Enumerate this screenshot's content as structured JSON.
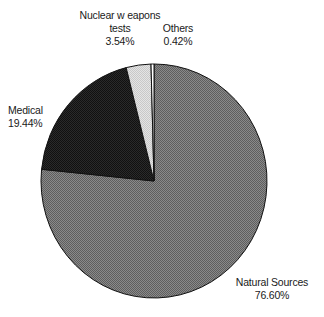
{
  "chart_data": {
    "type": "pie",
    "title": "",
    "start_angle": "12 o'clock",
    "direction": "clockwise",
    "slices": [
      {
        "label": "Natural Sources",
        "value": 76.6,
        "display": "76.60%",
        "color": "#7a7a7a"
      },
      {
        "label": "Medical",
        "value": 19.44,
        "display": "19.44%",
        "color": "#1e1e1e"
      },
      {
        "label": "Nuclear w eapons tests",
        "value": 3.54,
        "display": "3.54%",
        "color": "#d8d8d8"
      },
      {
        "label": "Others",
        "value": 0.42,
        "display": "0.42%",
        "color": "#ffffff"
      }
    ],
    "categories": [
      "Natural Sources",
      "Medical",
      "Nuclear w eapons tests",
      "Others"
    ],
    "values": [
      76.6,
      19.44,
      3.54,
      0.42
    ],
    "legend": "none (direct labels)"
  },
  "labels": {
    "nuclear_line1": "Nuclear w eapons",
    "nuclear_line2": "tests",
    "nuclear_pct": "3.54%",
    "others_name": "Others",
    "others_pct": "0.42%",
    "medical_name": "Medical",
    "medical_pct": "19.44%",
    "natural_name": "Natural Sources",
    "natural_pct": "76.60%"
  }
}
